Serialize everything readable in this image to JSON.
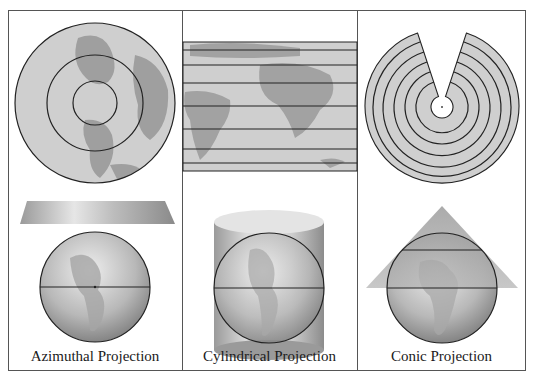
{
  "figure": {
    "panels": [
      {
        "id": "azimuthal",
        "label": "Azimuthal Projection",
        "map_shape": "concentric circles (polar view)",
        "surface": "tangent plane"
      },
      {
        "id": "cylindrical",
        "label": "Cylindrical Projection",
        "map_shape": "rectangle with horizontal parallels",
        "surface": "cylinder"
      },
      {
        "id": "conic",
        "label": "Conic Projection",
        "map_shape": "fan of concentric arcs",
        "surface": "cone"
      }
    ]
  },
  "colors": {
    "frame": "#555555",
    "line": "#222222",
    "land": "#9a9a9a",
    "ocean": "#cfcfcf"
  }
}
